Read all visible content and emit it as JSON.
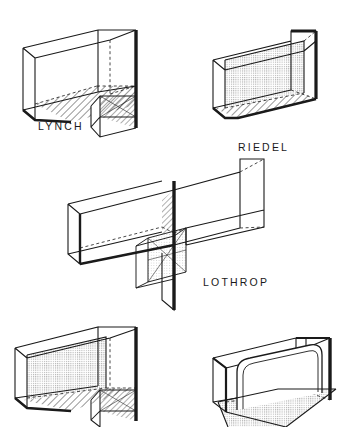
{
  "page": {
    "background_color": "#ffffff",
    "ink_color": "#1a1a1a",
    "width": 343,
    "height": 427
  },
  "diagram": {
    "type": "isometric-line-drawing-plate",
    "figure_count": 5,
    "labeled_figure_count": 3,
    "line_styles": {
      "visible_edge": "solid thin black",
      "hidden_edge": "dashed thin black",
      "emphasis_edge": "thick solid black",
      "floor_fill": "diagonal hatch",
      "wall_fill": "fine dot stipple"
    }
  },
  "figures": [
    {
      "id": "figure-lynch",
      "label": "LYNCH",
      "position": "top-left",
      "label_x": 38,
      "label_y": 130,
      "form": "U-shaped enclosure with descending leg at right",
      "fills": [
        "hatched floor",
        "hatched descending leg"
      ],
      "emphasis": "thick right vertical edge"
    },
    {
      "id": "figure-riedel",
      "label": "RIEDEL",
      "position": "top-right",
      "label_x": 238,
      "label_y": 151,
      "form": "Open rectangular trough",
      "fills": [
        "stippled back wall",
        "hatched floor"
      ],
      "emphasis": "thick right vertical edge and base edge"
    },
    {
      "id": "figure-lothrop",
      "label": "LOTHROP",
      "position": "middle-center",
      "label_x": 203,
      "label_y": 286,
      "form": "Long horizontal beam with central vertical divider and descending box",
      "fills": [
        "hatched divider panel",
        "light stippled drop box"
      ],
      "emphasis": "thick central vertical fin"
    },
    {
      "id": "figure-bottom-left",
      "label": "",
      "position": "bottom-left",
      "form": "U-shaped enclosure with descending leg at right",
      "fills": [
        "stippled back wall",
        "hatched floor",
        "hatched descending leg"
      ],
      "emphasis": "thick right vertical edge"
    },
    {
      "id": "figure-bottom-right",
      "label": "",
      "position": "bottom-right",
      "form": "Open enclosure with rounded inner panel and outward extending floor",
      "fills": [
        "stippled extended floor"
      ],
      "emphasis": "thick right vertical edge"
    }
  ],
  "labels": {
    "lynch": "LYNCH",
    "riedel": "RIEDEL",
    "lothrop": "LOTHROP"
  }
}
